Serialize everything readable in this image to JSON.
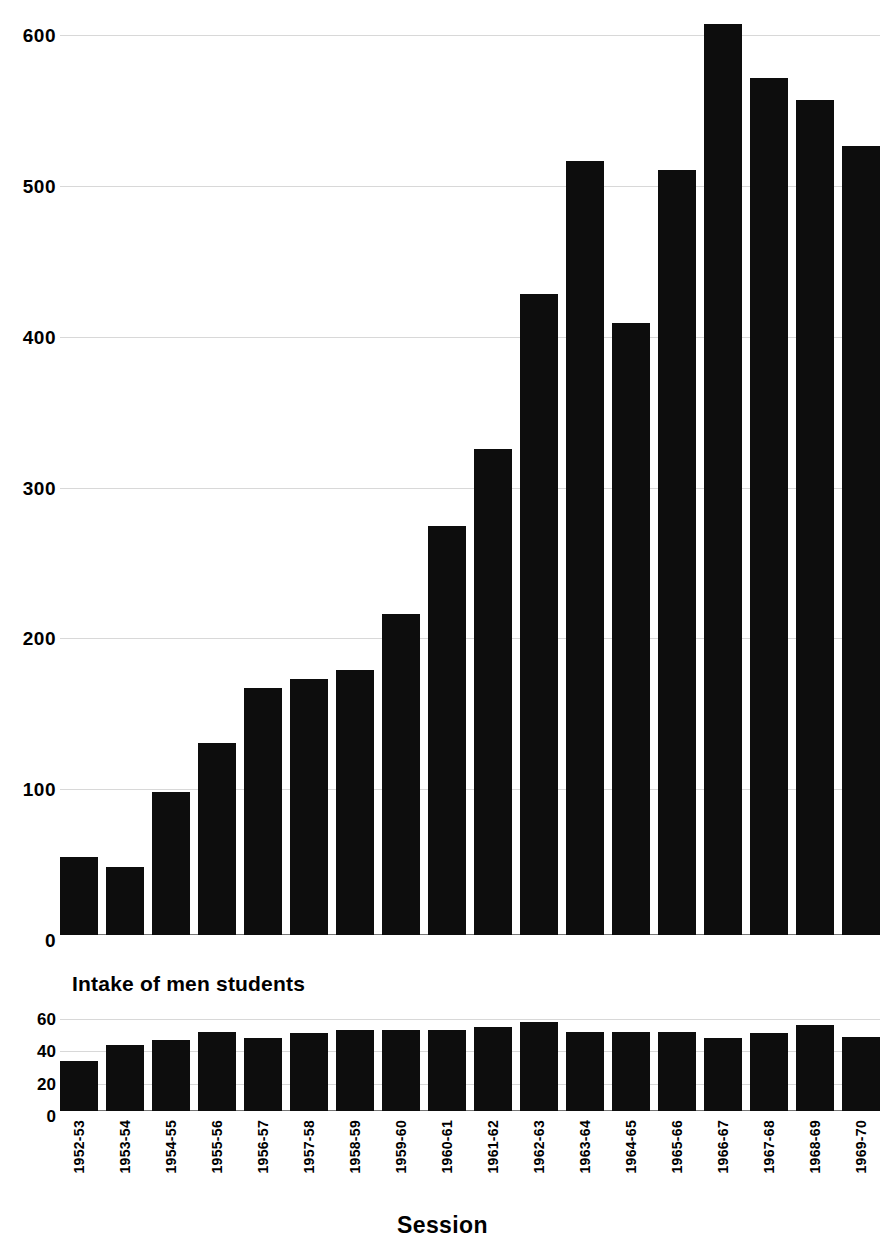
{
  "chart_data": [
    {
      "type": "bar",
      "title": "",
      "xlabel": "Session",
      "ylabel": "",
      "ylim": [
        0,
        620
      ],
      "yticks": [
        0,
        100,
        200,
        300,
        400,
        500,
        600
      ],
      "grid": true,
      "legend": "none",
      "bar_color": "#0d0d0d",
      "categories": [
        "1952-53",
        "1953-54",
        "1954-55",
        "1955-56",
        "1956-57",
        "1957-58",
        "1958-59",
        "1959-60",
        "1960-61",
        "1961-62",
        "1962-63",
        "1963-64",
        "1964-65",
        "1965-66",
        "1966-67",
        "1967-68",
        "1968-69",
        "1969-70"
      ],
      "values": [
        52,
        45,
        95,
        127,
        164,
        170,
        176,
        213,
        271,
        322,
        425,
        513,
        406,
        507,
        604,
        568,
        554,
        523
      ]
    },
    {
      "type": "bar",
      "title": "Intake of men students",
      "xlabel": "Session",
      "ylabel": "",
      "ylim": [
        0,
        65
      ],
      "yticks": [
        0,
        20,
        40,
        60
      ],
      "grid": true,
      "legend": "none",
      "bar_color": "#0d0d0d",
      "categories": [
        "1952-53",
        "1953-54",
        "1954-55",
        "1955-56",
        "1956-57",
        "1957-58",
        "1958-59",
        "1959-60",
        "1960-61",
        "1961-62",
        "1962-63",
        "1963-64",
        "1964-65",
        "1965-66",
        "1966-67",
        "1967-68",
        "1968-69",
        "1969-70"
      ],
      "values": [
        31,
        41,
        44,
        49,
        45,
        48,
        50,
        50,
        50,
        52,
        55,
        49,
        49,
        49,
        45,
        48,
        53,
        46
      ]
    }
  ],
  "main": {
    "yticks": [
      "600",
      "500",
      "400",
      "300",
      "200",
      "100",
      "0"
    ]
  },
  "sub": {
    "title": "Intake of men students",
    "yticks": [
      "60",
      "40",
      "20",
      "0"
    ]
  },
  "xaxis": {
    "title": "Session",
    "labels": [
      "1952-53",
      "1953-54",
      "1954-55",
      "1955-56",
      "1956-57",
      "1957-58",
      "1958-59",
      "1959-60",
      "1960-61",
      "1961-62",
      "1962-63",
      "1963-64",
      "1964-65",
      "1965-66",
      "1966-67",
      "1967-68",
      "1968-69",
      "1969-70"
    ]
  }
}
